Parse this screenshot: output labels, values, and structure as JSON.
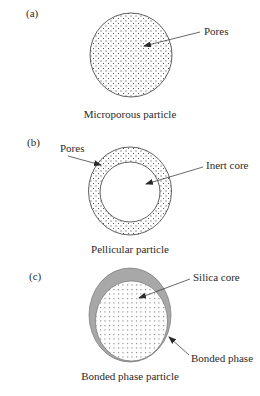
{
  "figure": {
    "panels": [
      {
        "id": "a",
        "panel_label": "(a)",
        "caption": "Microporous particle",
        "callouts": [
          {
            "text": "Pores"
          }
        ]
      },
      {
        "id": "b",
        "panel_label": "(b)",
        "caption": "Pellicular particle",
        "callouts": [
          {
            "text": "Pores"
          },
          {
            "text": "Inert core"
          }
        ]
      },
      {
        "id": "c",
        "panel_label": "(c)",
        "caption": "Bonded phase particle",
        "callouts": [
          {
            "text": "Silica core"
          },
          {
            "text": "Bonded phase"
          }
        ]
      }
    ],
    "colors": {
      "outline": "#3a3a3a",
      "dots": "#3a3a3a",
      "bonded_phase": "#a8a8a8",
      "background": "#ffffff"
    }
  }
}
